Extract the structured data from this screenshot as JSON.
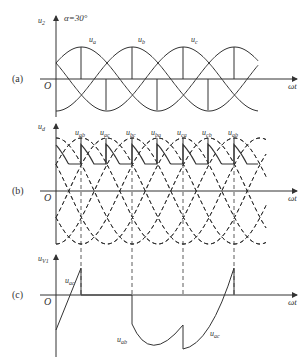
{
  "figure": {
    "alpha_label": "α=30°",
    "x_axis_label": "ωt",
    "origin_label": "O",
    "panels": [
      {
        "id": "a",
        "tag": "(a)",
        "y_label_main": "u",
        "y_label_sub": "2",
        "curve_labels": [
          {
            "main": "u",
            "sub": "a"
          },
          {
            "main": "u",
            "sub": "b"
          },
          {
            "main": "u",
            "sub": "c"
          }
        ]
      },
      {
        "id": "b",
        "tag": "(b)",
        "y_label_main": "u",
        "y_label_sub": "d",
        "curve_labels": [
          {
            "main": "u",
            "sub": "ab"
          },
          {
            "main": "u",
            "sub": "ac"
          },
          {
            "main": "u",
            "sub": "bc"
          },
          {
            "main": "u",
            "sub": "ba"
          },
          {
            "main": "u",
            "sub": "ca"
          },
          {
            "main": "u",
            "sub": "cb"
          },
          {
            "main": "u",
            "sub": "ab"
          }
        ]
      },
      {
        "id": "c",
        "tag": "(c)",
        "y_label_main": "u",
        "y_label_sub": "V1",
        "curve_labels": [
          {
            "main": "u",
            "sub": "ac"
          },
          {
            "main": "u",
            "sub": "ab"
          },
          {
            "main": "u",
            "sub": "ac"
          }
        ]
      }
    ]
  }
}
